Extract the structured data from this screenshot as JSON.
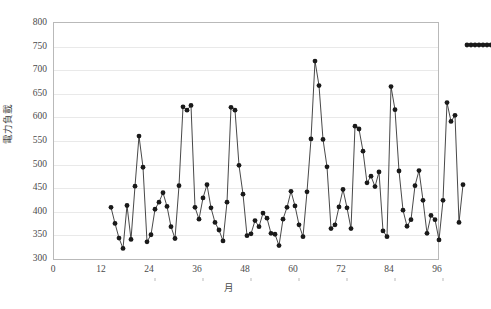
{
  "chart_data": {
    "type": "line",
    "title": "",
    "subtitle": "",
    "xlabel": "月",
    "ylabel": "電力負載",
    "xlim": [
      0,
      96
    ],
    "ylim": [
      300,
      800
    ],
    "ytick_step": 50,
    "xtick_step": 12,
    "grid": true,
    "legend": "none",
    "marker": "filled-circle",
    "marker_color": "#1a1a1a",
    "line_color": "#333333",
    "x": [
      1,
      2,
      3,
      4,
      5,
      6,
      7,
      8,
      9,
      10,
      11,
      12,
      13,
      14,
      15,
      16,
      17,
      18,
      19,
      20,
      21,
      22,
      23,
      24,
      25,
      26,
      27,
      28,
      29,
      30,
      31,
      32,
      33,
      34,
      35,
      36,
      37,
      38,
      39,
      40,
      41,
      42,
      43,
      44,
      45,
      46,
      47,
      48,
      49,
      50,
      51,
      52,
      53,
      54,
      55,
      56,
      57,
      58,
      59,
      60,
      61,
      62,
      63,
      64,
      65,
      66,
      67,
      68,
      69,
      70,
      71,
      72,
      73,
      74,
      75,
      76,
      77,
      78,
      79,
      80,
      81,
      82,
      83,
      84,
      85,
      86,
      87,
      88,
      89,
      90,
      91,
      92,
      93,
      94,
      95,
      96
    ],
    "y": [
      456,
      422,
      391,
      369,
      460,
      388,
      501,
      607,
      541,
      383,
      398,
      452,
      467,
      487,
      458,
      415,
      390,
      502,
      669,
      662,
      672,
      456,
      431,
      476,
      504,
      455,
      424,
      408,
      385,
      467,
      668,
      662,
      545,
      484,
      396,
      400,
      428,
      415,
      444,
      433,
      401,
      399,
      375,
      431,
      456,
      490,
      459,
      419,
      394,
      489,
      601,
      766,
      714,
      600,
      542,
      411,
      419,
      457,
      494,
      455,
      411,
      628,
      622,
      575,
      508,
      522,
      500,
      531,
      406,
      394,
      712,
      663,
      533,
      450,
      416,
      430,
      502,
      534,
      471,
      401,
      439,
      430,
      387,
      471,
      678,
      638,
      651,
      424,
      504
    ],
    "ytick_labels": [
      "300",
      "350",
      "400",
      "450",
      "500",
      "550",
      "600",
      "650",
      "700",
      "750",
      "800"
    ],
    "xtick_labels": [
      "0",
      "12",
      "24",
      "36",
      "48",
      "60",
      "72",
      "84",
      "96"
    ],
    "axis_color": "#b9b9b9",
    "grid_color": "#e9e9e9"
  },
  "axes": {
    "y_title": "電力負載",
    "x_title": "月"
  }
}
